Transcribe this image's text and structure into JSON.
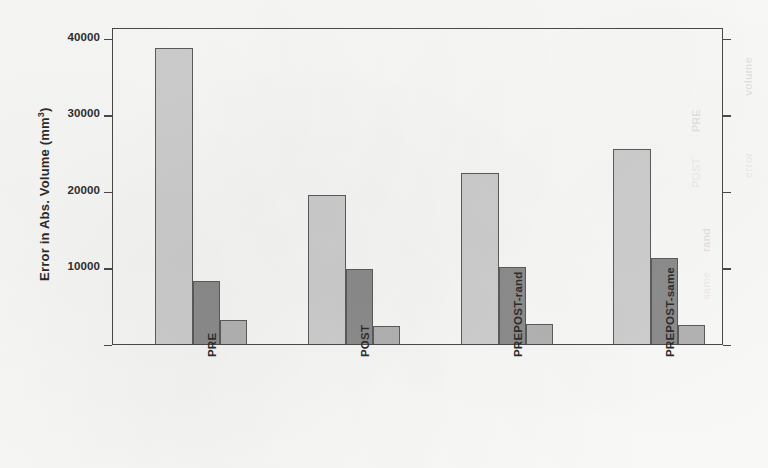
{
  "chart_data": {
    "type": "bar",
    "title": "",
    "subtitle": "",
    "xlabel": "",
    "ylabel": "Error in Abs. Volume  (mm3)",
    "ylabel_text": "Error in Abs. Volume  (mm",
    "ylabel_sup": "3",
    "ylabel_suffix": ")",
    "categories": [
      "PRE",
      "POST",
      "PREPOST-rand",
      "PREPOST-same"
    ],
    "series": [
      {
        "name": "series-1-light",
        "color": "#d0d0d0",
        "values": [
          38600,
          19400,
          22300,
          25500
        ]
      },
      {
        "name": "series-2-dark",
        "color": "#8e8e8e",
        "values": [
          8200,
          9800,
          10100,
          11200
        ]
      },
      {
        "name": "series-3-mid",
        "color": "#b5b5b5",
        "values": [
          3100,
          2300,
          2600,
          2500
        ]
      }
    ],
    "ytick_labels": [
      "40000",
      "30000",
      "20000",
      "10000"
    ],
    "ytick_values": [
      40000,
      30000,
      20000,
      10000
    ],
    "ylim": [
      0,
      41400
    ],
    "grid": false,
    "legend": "none",
    "frame": "full-box",
    "ticks_left": true,
    "ticks_right": true,
    "bar_border_color": "#5c5c5c"
  },
  "ghost_marks": [
    {
      "text": "volume",
      "x": 742,
      "y": 96
    },
    {
      "text": "error",
      "x": 742,
      "y": 178
    },
    {
      "text": "PRE",
      "x": 690,
      "y": 132
    },
    {
      "text": "POST",
      "x": 690,
      "y": 188
    },
    {
      "text": "rand",
      "x": 700,
      "y": 252
    },
    {
      "text": "same",
      "x": 700,
      "y": 300
    }
  ]
}
